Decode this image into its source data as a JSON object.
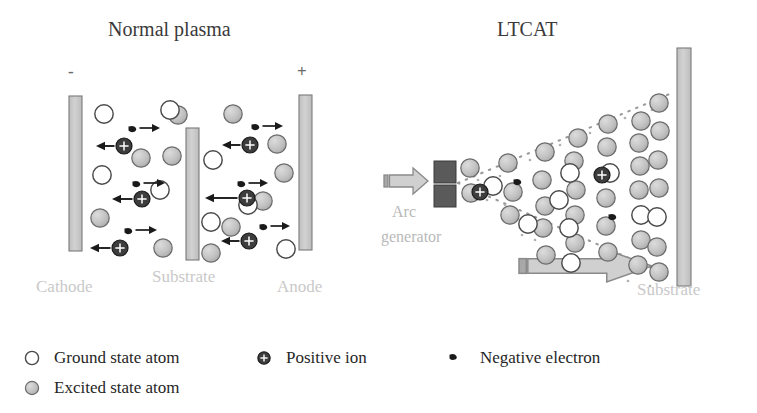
{
  "figure": {
    "type": "diagram",
    "background": "#ffffff"
  },
  "panels": {
    "left": {
      "title": "Normal plasma",
      "title_pos": {
        "x": 108,
        "y": 18
      },
      "electrodes": [
        {
          "name": "Cathode",
          "label": "Cathode",
          "label_pos": {
            "x": 36,
            "y": 277
          },
          "sign": "-",
          "sign_pos": {
            "x": 68,
            "y": 62
          },
          "rect": {
            "x": 69,
            "y": 96,
            "w": 13,
            "h": 155
          }
        },
        {
          "name": "Substrate",
          "label": "Substrate",
          "label_pos": {
            "x": 152,
            "y": 267
          },
          "sign": "",
          "sign_pos": {
            "x": 0,
            "y": 0
          },
          "rect": {
            "x": 186,
            "y": 128,
            "w": 13,
            "h": 132
          }
        },
        {
          "name": "Anode",
          "label": "Anode",
          "label_pos": {
            "x": 277,
            "y": 277
          },
          "sign": "+",
          "sign_pos": {
            "x": 297,
            "y": 62
          },
          "rect": {
            "x": 299,
            "y": 95,
            "w": 13,
            "h": 155
          }
        }
      ]
    },
    "right": {
      "title": "LTCAT",
      "title_pos": {
        "x": 497,
        "y": 18
      },
      "arc_generator": {
        "label_line1": "Arc",
        "label_line2": "generator",
        "label1_pos": {
          "x": 392,
          "y": 203
        },
        "label2_pos": {
          "x": 381,
          "y": 228
        },
        "blocks": [
          {
            "x": 434,
            "y": 161,
            "w": 22,
            "h": 22
          },
          {
            "x": 434,
            "y": 185,
            "w": 22,
            "h": 22
          }
        ],
        "feed_arrow": {
          "x": 384,
          "y": 168,
          "w": 44,
          "h": 26,
          "direction": "right"
        }
      },
      "substrate": {
        "label": "Substrate",
        "label_pos": {
          "x": 637,
          "y": 280
        },
        "rect": {
          "x": 677,
          "y": 48,
          "w": 14,
          "h": 238
        }
      },
      "motion_arrow": {
        "x": 519,
        "y": 250,
        "w": 133,
        "h": 32,
        "direction": "right"
      },
      "plume": {
        "apex": {
          "x": 458,
          "y": 183
        },
        "top_edge_end": {
          "x": 672,
          "y": 93
        },
        "bottom_edge_end": {
          "x": 672,
          "y": 277
        },
        "style": "dotted"
      }
    }
  },
  "legend": {
    "items": [
      {
        "symbol": "ground-state-atom",
        "label": "Ground state atom",
        "x": 44,
        "y": 348
      },
      {
        "symbol": "positive-ion",
        "label": "Positive ion",
        "x": 276,
        "y": 348
      },
      {
        "symbol": "negative-electron",
        "label": "Negative electron",
        "x": 470,
        "y": 348
      },
      {
        "symbol": "excited-state-atom",
        "label": "Excited state atom",
        "x": 44,
        "y": 378
      }
    ]
  },
  "colors": {
    "ground_state_fill": "#ffffff",
    "ground_state_stroke": "#4a4a4a",
    "excited_state_fill": "#bdbdbd",
    "excited_state_stroke": "#6d6d6d",
    "positive_ion_fill": "#3d3d3d",
    "positive_ion_stroke": "#1a1a1a",
    "electron": "#1a1a1a",
    "bar_fill": "#c8c8c8",
    "bar_stroke": "#7a7a7a",
    "arc_block_fill": "#5a5a5a",
    "arrow_fill": "#d0d0d0",
    "arrow_stroke": "#8a8a8a",
    "faded_label": "#c9c9c9",
    "title": "#3a3a3a"
  },
  "particles": {
    "left_panel": {
      "ground_state_atoms": [
        {
          "x": 104,
          "y": 114
        },
        {
          "x": 102,
          "y": 175
        },
        {
          "x": 160,
          "y": 190
        },
        {
          "x": 213,
          "y": 160
        },
        {
          "x": 211,
          "y": 222
        },
        {
          "x": 286,
          "y": 249
        },
        {
          "x": 170,
          "y": 110
        },
        {
          "x": 248,
          "y": 205
        }
      ],
      "excited_state_atoms": [
        {
          "x": 178,
          "y": 115
        },
        {
          "x": 233,
          "y": 114
        },
        {
          "x": 141,
          "y": 158
        },
        {
          "x": 172,
          "y": 156
        },
        {
          "x": 100,
          "y": 218
        },
        {
          "x": 163,
          "y": 248
        },
        {
          "x": 211,
          "y": 253
        },
        {
          "x": 277,
          "y": 144
        },
        {
          "x": 284,
          "y": 173
        },
        {
          "x": 263,
          "y": 201
        },
        {
          "x": 231,
          "y": 227
        }
      ],
      "positive_ions": [
        {
          "x": 124,
          "y": 146,
          "arrow_to": {
            "x": 96,
            "y": 146
          }
        },
        {
          "x": 142,
          "y": 199,
          "arrow_to": {
            "x": 112,
            "y": 199
          }
        },
        {
          "x": 120,
          "y": 248,
          "arrow_to": {
            "x": 90,
            "y": 248
          }
        },
        {
          "x": 250,
          "y": 145,
          "arrow_to": {
            "x": 222,
            "y": 145
          }
        },
        {
          "x": 247,
          "y": 198,
          "arrow_to": {
            "x": 205,
            "y": 198
          }
        },
        {
          "x": 249,
          "y": 241,
          "arrow_to": {
            "x": 221,
            "y": 241
          }
        }
      ],
      "electrons": [
        {
          "x": 134,
          "y": 130,
          "arrow_to": {
            "x": 160,
            "y": 128
          }
        },
        {
          "x": 138,
          "y": 185,
          "arrow_to": {
            "x": 165,
            "y": 183
          }
        },
        {
          "x": 130,
          "y": 232,
          "arrow_to": {
            "x": 157,
            "y": 230
          }
        },
        {
          "x": 257,
          "y": 128,
          "arrow_to": {
            "x": 283,
            "y": 126
          }
        },
        {
          "x": 243,
          "y": 185,
          "arrow_to": {
            "x": 268,
            "y": 183
          }
        },
        {
          "x": 265,
          "y": 228,
          "arrow_to": {
            "x": 290,
            "y": 226
          }
        }
      ]
    },
    "right_panel": {
      "ground_state_atoms": [
        {
          "x": 493,
          "y": 186
        },
        {
          "x": 570,
          "y": 173
        },
        {
          "x": 559,
          "y": 200
        },
        {
          "x": 569,
          "y": 228
        },
        {
          "x": 571,
          "y": 263
        },
        {
          "x": 610,
          "y": 173
        },
        {
          "x": 641,
          "y": 215
        },
        {
          "x": 657,
          "y": 217
        },
        {
          "x": 528,
          "y": 224
        }
      ],
      "excited_state_atoms": [
        {
          "x": 470,
          "y": 168
        },
        {
          "x": 471,
          "y": 193
        },
        {
          "x": 508,
          "y": 163
        },
        {
          "x": 513,
          "y": 192
        },
        {
          "x": 510,
          "y": 215
        },
        {
          "x": 545,
          "y": 152
        },
        {
          "x": 542,
          "y": 180
        },
        {
          "x": 545,
          "y": 206
        },
        {
          "x": 543,
          "y": 228
        },
        {
          "x": 546,
          "y": 255
        },
        {
          "x": 578,
          "y": 138
        },
        {
          "x": 574,
          "y": 161
        },
        {
          "x": 576,
          "y": 190
        },
        {
          "x": 575,
          "y": 215
        },
        {
          "x": 575,
          "y": 243
        },
        {
          "x": 608,
          "y": 124
        },
        {
          "x": 607,
          "y": 147
        },
        {
          "x": 606,
          "y": 198
        },
        {
          "x": 606,
          "y": 226
        },
        {
          "x": 608,
          "y": 252
        },
        {
          "x": 641,
          "y": 121
        },
        {
          "x": 639,
          "y": 143
        },
        {
          "x": 640,
          "y": 166
        },
        {
          "x": 639,
          "y": 190
        },
        {
          "x": 641,
          "y": 240
        },
        {
          "x": 638,
          "y": 265
        },
        {
          "x": 659,
          "y": 103
        },
        {
          "x": 660,
          "y": 131
        },
        {
          "x": 658,
          "y": 160
        },
        {
          "x": 659,
          "y": 188
        },
        {
          "x": 657,
          "y": 247
        },
        {
          "x": 659,
          "y": 272
        }
      ],
      "positive_ions": [
        {
          "x": 480,
          "y": 192
        },
        {
          "x": 602,
          "y": 175
        }
      ],
      "electrons": [
        {
          "x": 519,
          "y": 183
        },
        {
          "x": 614,
          "y": 218
        }
      ]
    }
  }
}
